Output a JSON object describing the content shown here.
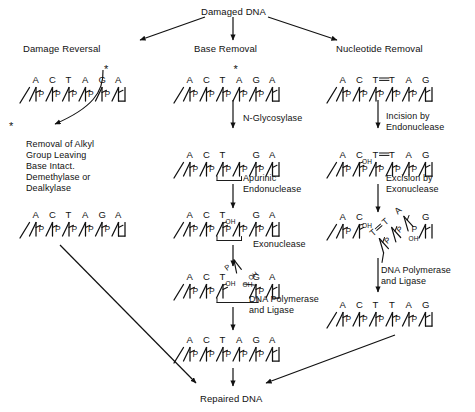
{
  "diagram": {
    "title_top": "Damaged DNA",
    "title_bottom": "Repaired DNA",
    "pathways": [
      {
        "id": "damage-reversal",
        "heading": "Damage Reversal",
        "enzyme_note": "Removal of Alkyl\nGroup Leaving\nBase Intact.\nDemethylase or\nDealkylase",
        "strands": [
          {
            "bases": [
              "A",
              "C",
              "T",
              "A",
              "G",
              "A"
            ],
            "mark": "asterisk-on-G"
          },
          {
            "bases": [
              "A",
              "C",
              "T",
              "A",
              "G",
              "A"
            ],
            "mark": "none"
          }
        ],
        "released_group": "*"
      },
      {
        "id": "base-removal",
        "heading": "Base Removal",
        "steps": [
          "N-Glycosylase",
          "Apurinic\nEndonuclease",
          "Exonuclease",
          "DNA Polymerase\nand Ligase"
        ],
        "strands": [
          {
            "bases": [
              "A",
              "C",
              "T",
              "A",
              "G",
              "A"
            ],
            "mark": "asterisk-on-A4"
          },
          {
            "bases": [
              "A",
              "C",
              "T",
              "",
              "G",
              "A"
            ],
            "mark": "ap-site"
          },
          {
            "bases": [
              "A",
              "C",
              "T",
              "",
              "G",
              "A"
            ],
            "mark": "oh-left"
          },
          {
            "bases": [
              "A",
              "C",
              "T",
              "",
              "G",
              "A"
            ],
            "mark": "gap-oh-both"
          },
          {
            "bases": [
              "A",
              "C",
              "T",
              "A",
              "G",
              "A"
            ],
            "mark": "none"
          }
        ]
      },
      {
        "id": "nucleotide-removal",
        "heading": "Nucleotide Removal",
        "steps": [
          "Incision by\nEndonuclease",
          "Excision by\nExonuclease",
          "DNA Polymerase\nand Ligase"
        ],
        "strands": [
          {
            "bases": [
              "A",
              "C",
              "T",
              "T",
              "A",
              "G"
            ],
            "mark": "dimer-T-T"
          },
          {
            "bases": [
              "A",
              "C",
              "T",
              "T",
              "A",
              "G"
            ],
            "mark": "dimer-T-T-oh"
          },
          {
            "bases": [
              "A",
              "C",
              "",
              "",
              "",
              "G"
            ],
            "mark": "excised-fragment"
          },
          {
            "bases": [
              "A",
              "C",
              "T",
              "T",
              "A",
              "G"
            ],
            "mark": "none"
          }
        ],
        "excised_fragment_bases": [
          "T",
          "T",
          "A"
        ]
      }
    ],
    "glyphs": {
      "phosphate": "P",
      "hydroxyl": "OH",
      "asterisk": "*",
      "dimer_bond": "="
    },
    "labels": {
      "n_glycosylase": "N-Glycosylase",
      "apurinic_endonuclease_l1": "Apurinic",
      "apurinic_endonuclease_l2": "Endonuclease",
      "exonuclease": "Exonuclease",
      "dna_pol_ligase_l1": "DNA Polymerase",
      "dna_pol_ligase_l2": "and Ligase",
      "incision_l1": "Incision by",
      "incision_l2": "Endonuclease",
      "excision_l1": "Excision by",
      "excision_l2": "Exonuclease",
      "dna_pol_ligase2_l1": "DNA Polymerase",
      "dna_pol_ligase2_l2": "and Ligase",
      "alkyl_l1": "Removal of Alkyl",
      "alkyl_l2": "Group Leaving",
      "alkyl_l3": "Base Intact.",
      "alkyl_l4": "Demethylase or",
      "alkyl_l5": "Dealkylase"
    },
    "colors": {
      "ink": "#111111",
      "background": "#ffffff"
    }
  }
}
